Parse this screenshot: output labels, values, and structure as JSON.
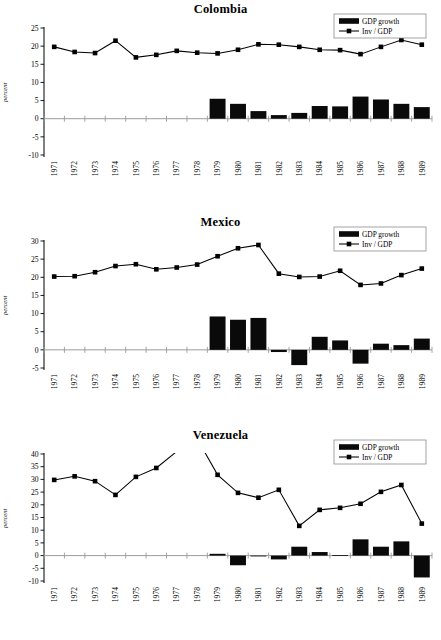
{
  "figure": {
    "ylabel": "percent",
    "legend": {
      "bar_label": "GDP growth",
      "line_label": "Inv / GDP"
    },
    "colors": {
      "bar": "#0a0a0a",
      "line": "#000000",
      "zero_line": "#9b9b9b",
      "axis": "#000000",
      "background": "#ffffff"
    }
  },
  "chart_data": [
    {
      "type": "bar",
      "title": "Colombia",
      "xlabel": "",
      "ylabel": "percent",
      "ylim": [
        -10,
        25
      ],
      "yticks": [
        -10,
        -5,
        0,
        5,
        10,
        15,
        20,
        25
      ],
      "grid": false,
      "legend_position": "top-right",
      "categories": [
        "1971",
        "1972",
        "1973",
        "1974",
        "1975",
        "1976",
        "1977",
        "1978",
        "1979",
        "1980",
        "1981",
        "1982",
        "1983",
        "1984",
        "1985",
        "1986",
        "1987",
        "1988",
        "1989"
      ],
      "series": [
        {
          "name": "GDP growth",
          "type": "bar",
          "values": [
            null,
            null,
            null,
            null,
            null,
            null,
            null,
            null,
            5.5,
            4.1,
            2.1,
            1.0,
            1.6,
            3.5,
            3.4,
            6.1,
            5.3,
            4.1,
            3.2
          ]
        },
        {
          "name": "Inv / GDP",
          "type": "line",
          "values": [
            19.8,
            18.4,
            18.1,
            21.5,
            16.9,
            17.6,
            18.7,
            18.2,
            18.0,
            19.0,
            20.5,
            20.4,
            19.8,
            19.0,
            18.9,
            17.8,
            19.8,
            21.7,
            20.4
          ]
        }
      ]
    },
    {
      "type": "bar",
      "title": "Mexico",
      "xlabel": "",
      "ylabel": "percent",
      "ylim": [
        -5,
        30
      ],
      "yticks": [
        -5,
        0,
        5,
        10,
        15,
        20,
        25,
        30
      ],
      "grid": false,
      "legend_position": "top-right",
      "categories": [
        "1971",
        "1972",
        "1973",
        "1974",
        "1975",
        "1976",
        "1977",
        "1978",
        "1979",
        "1980",
        "1981",
        "1982",
        "1983",
        "1984",
        "1985",
        "1986",
        "1987",
        "1988",
        "1989"
      ],
      "series": [
        {
          "name": "GDP growth",
          "type": "bar",
          "values": [
            null,
            null,
            null,
            null,
            null,
            null,
            null,
            null,
            9.2,
            8.3,
            8.8,
            -0.6,
            -4.2,
            3.6,
            2.6,
            -3.8,
            1.7,
            1.3,
            3.1
          ]
        },
        {
          "name": "Inv / GDP",
          "type": "line",
          "values": [
            20.2,
            20.3,
            21.4,
            23.1,
            23.6,
            22.2,
            22.7,
            23.5,
            25.8,
            28.0,
            28.9,
            21.0,
            20.1,
            20.2,
            21.8,
            17.9,
            18.3,
            20.6,
            22.4
          ]
        }
      ]
    },
    {
      "type": "bar",
      "title": "Venezuela",
      "xlabel": "",
      "ylabel": "percent",
      "ylim": [
        -10,
        40
      ],
      "yticks": [
        -10,
        -5,
        0,
        5,
        10,
        15,
        20,
        25,
        30,
        35,
        40
      ],
      "grid": false,
      "legend_position": "top-right",
      "categories": [
        "1971",
        "1972",
        "1973",
        "1974",
        "1975",
        "1976",
        "1977",
        "1978",
        "1979",
        "1980",
        "1981",
        "1982",
        "1983",
        "1984",
        "1985",
        "1986",
        "1987",
        "1988",
        "1989"
      ],
      "series": [
        {
          "name": "GDP growth",
          "type": "bar",
          "values": [
            null,
            null,
            null,
            null,
            null,
            null,
            null,
            null,
            0.7,
            -3.8,
            -0.3,
            -1.5,
            3.5,
            1.4,
            0.2,
            6.4,
            3.5,
            5.6,
            -8.6
          ]
        },
        {
          "name": "Inv / GDP",
          "type": "line",
          "values": [
            29.8,
            31.2,
            29.3,
            23.9,
            31.0,
            34.5,
            41.0,
            46.0,
            31.8,
            24.7,
            22.8,
            25.9,
            11.7,
            18.0,
            18.8,
            20.4,
            25.1,
            27.8,
            12.6
          ]
        }
      ]
    }
  ]
}
